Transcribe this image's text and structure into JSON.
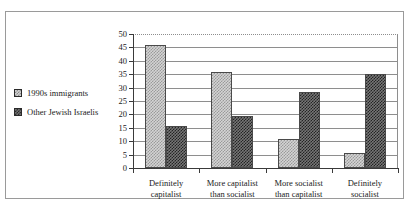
{
  "chart_data": {
    "type": "bar",
    "title": "",
    "xlabel": "",
    "ylabel": "",
    "ylim": [
      0,
      50
    ],
    "yticks": [
      0,
      5,
      10,
      15,
      20,
      25,
      30,
      35,
      40,
      45,
      50
    ],
    "grid": true,
    "legend_position": "left",
    "categories": [
      "Definitely capitalist",
      "More capitalist than socialist",
      "More socialist than capitalist",
      "Definitely socialist"
    ],
    "category_lines": [
      [
        "Definitely",
        "capitalist"
      ],
      [
        "More capitalist",
        "than socialist"
      ],
      [
        "More socialist",
        "than capitalist"
      ],
      [
        "Definitely",
        "socialist"
      ]
    ],
    "series": [
      {
        "name": "1990s immigrants",
        "pattern": "light-checker",
        "values": [
          46,
          36,
          11,
          5.5
        ]
      },
      {
        "name": "Other Jewish Israelis",
        "pattern": "dark-checker",
        "values": [
          15.5,
          19.5,
          28.5,
          35
        ]
      }
    ]
  },
  "legend": {
    "items": [
      {
        "label": "1990s immigrants",
        "swatch": "light-checker-swatch"
      },
      {
        "label": "Other Jewish Israelis",
        "swatch": "dark-checker-swatch"
      }
    ]
  },
  "axis": {
    "y_labels": [
      "50",
      "45",
      "40",
      "35",
      "30",
      "25",
      "20",
      "15",
      "10",
      "5",
      "0"
    ]
  },
  "colors": {
    "border": "#9a9a9a",
    "gridline": "#8e8e8e",
    "axis": "#3a3a3a",
    "bar_light_base": "#d4d4d4",
    "bar_light_pattern": "#9a9a9a",
    "bar_dark_base": "#767676",
    "bar_dark_pattern": "#242424",
    "text": "#1a1a1a"
  }
}
